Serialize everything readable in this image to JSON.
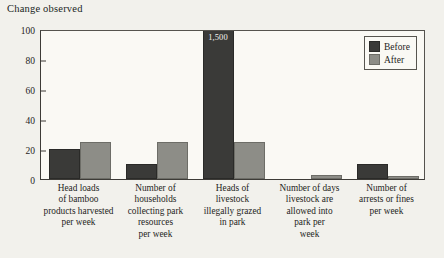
{
  "chart_data": {
    "type": "bar",
    "title": "Change observed",
    "xlabel": "",
    "ylabel": "",
    "ylim": [
      0,
      100
    ],
    "yticks": [
      0,
      20,
      40,
      60,
      80,
      100
    ],
    "grid": false,
    "legend_position": "top-right",
    "categories": [
      "Head loads of bamboo products harvested per week",
      "Number of households collecting park resources per week",
      "Heads of livestock illegally grazed in park",
      "Number of days livestock are allowed into park per week",
      "Number of arrests or fines per week"
    ],
    "category_lines": [
      [
        "Head loads",
        "of bamboo",
        "products harvested",
        "per week"
      ],
      [
        "Number of",
        "households",
        "collecting park",
        "resources",
        "per week"
      ],
      [
        "Heads of",
        "livestock",
        "illegally grazed",
        "in park"
      ],
      [
        "Number of days",
        "livestock are",
        "allowed into",
        "park per",
        "week"
      ],
      [
        "Number of",
        "arrests or fines",
        "per week"
      ]
    ],
    "series": [
      {
        "name": "Before",
        "color": "#3a3a38",
        "values": [
          20,
          10,
          1500,
          0,
          10
        ]
      },
      {
        "name": "After",
        "color": "#8d8d87",
        "values": [
          25,
          25,
          25,
          3,
          2
        ]
      }
    ],
    "annotations": [
      {
        "series": "Before",
        "category_index": 2,
        "text": "1,500",
        "note": "bar clipped at top of axis"
      }
    ]
  }
}
